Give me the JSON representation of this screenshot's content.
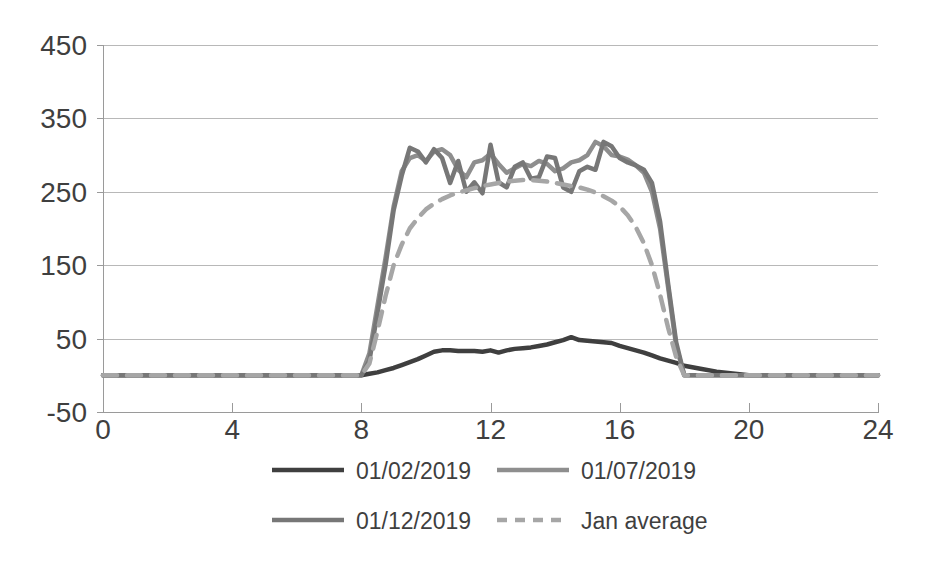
{
  "chart_data": {
    "type": "line",
    "title": "",
    "subtitle": "",
    "xlabel": "",
    "ylabel": "",
    "xlim": [
      0,
      24
    ],
    "ylim": [
      -50,
      450
    ],
    "y_ticks": [
      -50,
      50,
      150,
      250,
      350,
      450
    ],
    "x_ticks": [
      0,
      4,
      8,
      12,
      16,
      20,
      24
    ],
    "grid": "horizontal",
    "legend_position": "bottom",
    "colors": {
      "series_1": "#3f3f3f",
      "series_2": "#8e8e8e",
      "series_3": "#777777",
      "series_4": "#a6a6a6",
      "gridline": "#b8b8b8",
      "axis": "#9a9a9a",
      "text": "#3f3f3f",
      "background": "#ffffff"
    },
    "x": [
      0,
      0.5,
      1,
      1.5,
      2,
      2.5,
      3,
      3.5,
      4,
      4.5,
      5,
      5.5,
      6,
      6.5,
      7,
      7.5,
      8,
      8.25,
      8.5,
      8.75,
      9,
      9.25,
      9.5,
      9.75,
      10,
      10.25,
      10.5,
      10.75,
      11,
      11.25,
      11.5,
      11.75,
      12,
      12.25,
      12.5,
      12.75,
      13,
      13.25,
      13.5,
      13.75,
      14,
      14.25,
      14.5,
      14.75,
      15,
      15.25,
      15.5,
      15.75,
      16,
      16.25,
      16.5,
      16.75,
      17,
      17.25,
      17.5,
      17.75,
      18,
      18.5,
      19,
      20,
      21,
      22,
      23,
      24
    ],
    "series": [
      {
        "name": "01/02/2019",
        "style": "solid",
        "color": "#3f3f3f",
        "width": 4.5,
        "values": [
          0,
          0,
          0,
          0,
          0,
          0,
          0,
          0,
          0,
          0,
          0,
          0,
          0,
          0,
          0,
          0,
          0,
          2,
          4,
          7,
          10,
          14,
          18,
          22,
          27,
          32,
          34,
          34,
          33,
          33,
          33,
          32,
          34,
          31,
          34,
          36,
          37,
          38,
          40,
          42,
          45,
          48,
          52,
          48,
          47,
          46,
          45,
          44,
          40,
          37,
          34,
          31,
          27,
          23,
          20,
          17,
          13,
          9,
          5,
          0,
          0,
          0,
          0,
          0
        ]
      },
      {
        "name": "01/07/2019",
        "style": "solid",
        "color": "#8e8e8e",
        "width": 4.5,
        "values": [
          0,
          0,
          0,
          0,
          0,
          0,
          0,
          0,
          0,
          0,
          0,
          0,
          0,
          0,
          0,
          0,
          0,
          30,
          95,
          160,
          230,
          278,
          296,
          300,
          292,
          305,
          308,
          300,
          280,
          270,
          290,
          293,
          302,
          288,
          276,
          282,
          288,
          285,
          292,
          288,
          278,
          282,
          290,
          293,
          300,
          318,
          312,
          300,
          298,
          294,
          286,
          276,
          250,
          200,
          120,
          40,
          0,
          0,
          0,
          0,
          0,
          0,
          0,
          0
        ]
      },
      {
        "name": "01/12/2019",
        "style": "solid",
        "color": "#777777",
        "width": 4.5,
        "values": [
          0,
          0,
          0,
          0,
          0,
          0,
          0,
          0,
          0,
          0,
          0,
          0,
          0,
          0,
          0,
          0,
          0,
          20,
          85,
          150,
          225,
          272,
          310,
          305,
          290,
          308,
          296,
          262,
          292,
          250,
          263,
          248,
          314,
          263,
          256,
          284,
          290,
          268,
          270,
          298,
          296,
          256,
          250,
          278,
          284,
          280,
          318,
          312,
          296,
          290,
          286,
          280,
          262,
          210,
          125,
          45,
          0,
          0,
          0,
          0,
          0,
          0,
          0,
          0
        ]
      },
      {
        "name": "Jan average",
        "style": "dashed",
        "color": "#a6a6a6",
        "width": 4.5,
        "values": [
          0,
          0,
          0,
          0,
          0,
          0,
          0,
          0,
          0,
          0,
          0,
          0,
          0,
          0,
          0,
          0,
          0,
          16,
          60,
          108,
          150,
          178,
          200,
          214,
          226,
          234,
          240,
          245,
          249,
          252,
          255,
          258,
          260,
          262,
          264,
          265,
          266,
          266,
          265,
          264,
          262,
          260,
          258,
          256,
          253,
          249,
          244,
          238,
          230,
          218,
          202,
          180,
          150,
          110,
          65,
          25,
          0,
          0,
          0,
          0,
          0,
          0,
          0,
          0
        ]
      }
    ]
  },
  "legend": {
    "items": [
      {
        "label": "01/02/2019",
        "color": "#3f3f3f",
        "style": "solid"
      },
      {
        "label": "01/07/2019",
        "color": "#8e8e8e",
        "style": "solid"
      },
      {
        "label": "01/12/2019",
        "color": "#777777",
        "style": "solid"
      },
      {
        "label": "Jan average",
        "color": "#a6a6a6",
        "style": "dashed"
      }
    ]
  }
}
